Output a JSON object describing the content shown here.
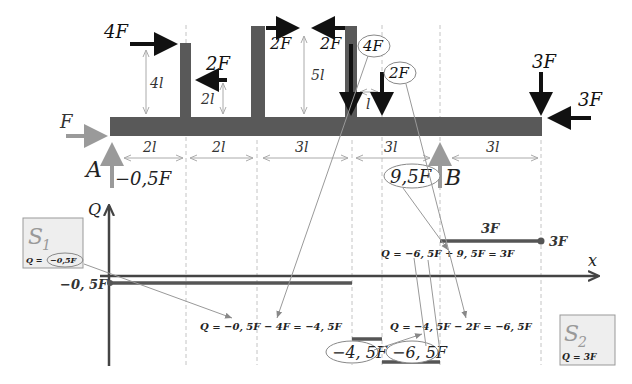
{
  "beam": {
    "support_A": {
      "label": "A",
      "reaction": "−0,5F"
    },
    "support_B": {
      "label": "B",
      "reaction": "9,5F"
    },
    "axial_force_left": "F",
    "forces": {
      "f_4F_horizontal": "4F",
      "f_2F_left_post": "2F",
      "f_2F_right_arrow": "2F",
      "f_2F_left_arrow": "2F",
      "f_4F_vertical": "4F",
      "f_2F_vertical": "2F",
      "f_3F_vertical": "3F",
      "f_3F_horizontal": "3F"
    },
    "post_heights": {
      "post1": "4l",
      "post1_arrow": "2l",
      "post2": "5l",
      "offset": "l"
    },
    "spans": [
      "2l",
      "2l",
      "3l",
      "3l",
      "3l"
    ]
  },
  "diagram": {
    "y_axis_label": "Q",
    "x_axis_label": "x",
    "level_labels": {
      "left": "−0, 5F",
      "right_end": "3F",
      "right_segment": "3F",
      "segment_4_5": "−4, 5F",
      "segment_6_5": "−6, 5F"
    },
    "formulas": {
      "f1": "Q = −0, 5F − 4F = −4, 5F",
      "f2": "Q = −4, 5F − 2F = −6, 5F",
      "f3": "Q = −6, 5F + 9, 5F = 3F"
    },
    "section_S1": {
      "title": "S",
      "sub": "1",
      "formula_prefix": "Q =",
      "formula_value": "−0,5F"
    },
    "section_S2": {
      "title": "S",
      "sub": "2",
      "formula": "Q = 3F"
    }
  },
  "colors": {
    "beam": "#595959",
    "force_black": "#111111",
    "reaction_gray": "#9a9a9a",
    "dim_line": "#b0b0b0",
    "dashed": "#c0c0c0",
    "section_box_bg": "#eeeeee",
    "section_box_border": "#999999"
  }
}
